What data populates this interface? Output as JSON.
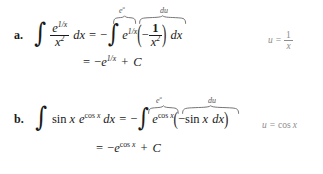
{
  "document": {
    "type": "math-worked-examples",
    "background_color": "#ffffff",
    "text_color": "#1a1a1a",
    "annotation_color": "#8d8d8d",
    "brace_label_color": "#555555"
  },
  "examples": [
    {
      "label": "a.",
      "line1": {
        "lhs_integral_sign": "∫",
        "lhs_numerator": "e",
        "lhs_numerator_exponent": "1/x",
        "lhs_denominator": "x",
        "lhs_denominator_exponent": "2",
        "lhs_differential": "dx",
        "equals": "=",
        "minus": "−",
        "rhs_integral_sign": "∫",
        "rhs_exp_base": "e",
        "rhs_exp_exponent": "1/x",
        "rhs_open_paren": "(",
        "rhs_inner_minus": "−",
        "rhs_inner_numerator": "1",
        "rhs_inner_denominator": "x",
        "rhs_inner_denominator_exponent": "2",
        "rhs_close_paren": ")",
        "rhs_differential": "dx"
      },
      "line2": {
        "equals": "=",
        "minus": "−",
        "base": "e",
        "exponent": "1/x",
        "plus": "+",
        "constant": "C"
      },
      "brace_labels": {
        "eu": "e",
        "eu_exponent": "u",
        "du": "du"
      },
      "substitution": {
        "variable": "u",
        "equals": "=",
        "numerator": "1",
        "denominator": "x"
      }
    },
    {
      "label": "b.",
      "line1": {
        "lhs_integral_sign": "∫",
        "lhs_sin": "sin",
        "lhs_sin_arg": "x",
        "lhs_exp_base": "e",
        "lhs_exp_cos": "cos",
        "lhs_exp_arg": "x",
        "lhs_differential": "dx",
        "equals": "=",
        "minus": "−",
        "rhs_integral_sign": "∫",
        "rhs_exp_base": "e",
        "rhs_exp_cos": "cos",
        "rhs_exp_arg": "x",
        "rhs_open_paren": "(",
        "rhs_inner_minus": "−",
        "rhs_inner_sin": "sin",
        "rhs_inner_arg": "x",
        "rhs_inner_differential": "dx",
        "rhs_close_paren": ")"
      },
      "line2": {
        "equals": "=",
        "minus": "−",
        "base": "e",
        "exp_cos": "cos",
        "exp_arg": "x",
        "plus": "+",
        "constant": "C"
      },
      "brace_labels": {
        "eu": "e",
        "eu_exponent": "u",
        "du": "du"
      },
      "substitution": {
        "variable": "u",
        "equals": "=",
        "cos": "cos",
        "arg": "x"
      }
    }
  ]
}
